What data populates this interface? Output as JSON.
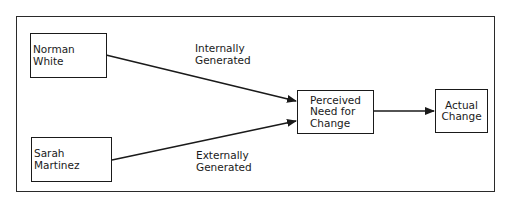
{
  "nodes": {
    "norman": "Norman White",
    "sarah": "Sarah Martinez",
    "perceived": [
      "Perceived",
      "Need for",
      "Change"
    ],
    "actual": [
      "Actual",
      "Change"
    ]
  },
  "edge_labels": {
    "internal": [
      "Internally",
      "Generated"
    ],
    "external": [
      "Externally",
      "Generated"
    ]
  }
}
